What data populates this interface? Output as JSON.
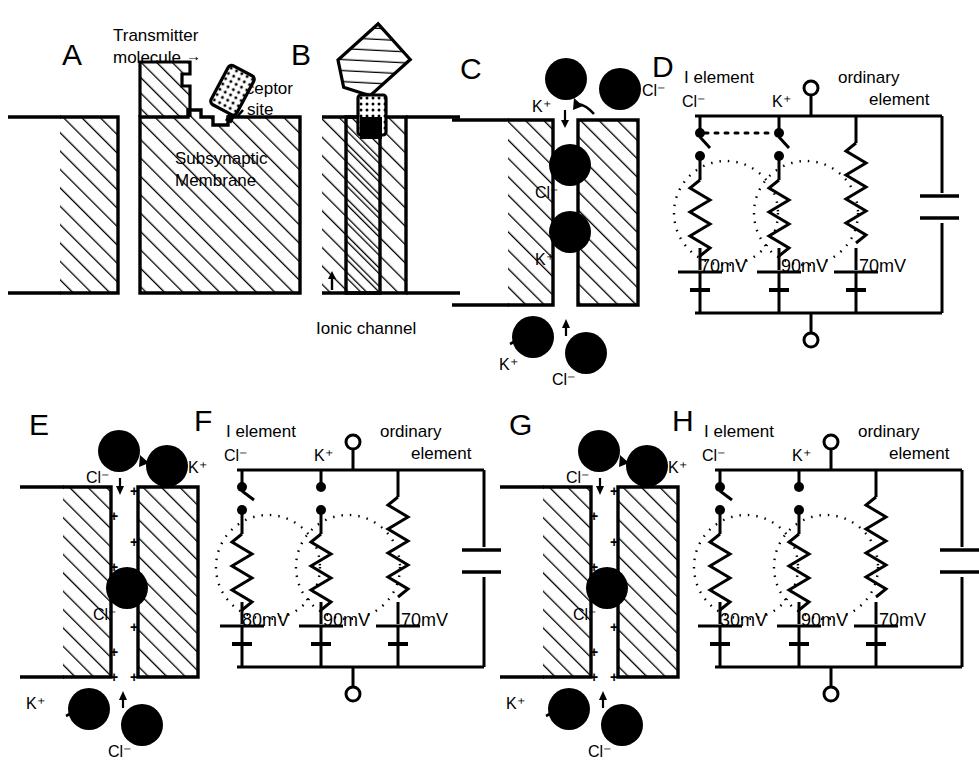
{
  "figure": {
    "background": "#ffffff",
    "ink": "#000000"
  },
  "panels": {
    "A": {
      "label": "A",
      "annotations": {
        "transmitter": "Transmitter",
        "molecule": "molecule",
        "arrow": "→",
        "receptor": "Receptor",
        "site": "site",
        "membrane_line1": "Subsynaptic",
        "membrane_line2": "Membrane"
      }
    },
    "B": {
      "label": "B",
      "annotations": {
        "ionic_channel": "Ionic channel"
      }
    },
    "C": {
      "label": "C",
      "ions": [
        {
          "name": "K+",
          "label": "K⁺",
          "position": "top-outside",
          "arrow": "down"
        },
        {
          "name": "Cl-",
          "label": "Cl⁻",
          "position": "top-right-outside",
          "arrow": "curved"
        },
        {
          "name": "Cl-",
          "label": "Cl⁻",
          "position": "channel-upper",
          "arrow": "none"
        },
        {
          "name": "K+",
          "label": "K⁺",
          "position": "channel-lower",
          "arrow": "none"
        },
        {
          "name": "K+",
          "label": "K⁺",
          "position": "bottom-left-outside",
          "arrow": "curved"
        },
        {
          "name": "Cl-",
          "label": "Cl⁻",
          "position": "bottom-outside",
          "arrow": "up"
        }
      ]
    },
    "D": {
      "label": "D",
      "headers": {
        "i_element": "I element",
        "ordinary_element_line1": "ordinary",
        "ordinary_element_line2": "element"
      },
      "branches": [
        {
          "ion": "Cl⁻",
          "emf": "70mV",
          "switch": "open",
          "linked": true
        },
        {
          "ion": "K⁺",
          "emf": "90mV",
          "switch": "open",
          "linked": true
        },
        {
          "ion": "",
          "emf": "70mV",
          "switch": "none",
          "linked": false
        }
      ],
      "has_capacitor": true,
      "terminals": {
        "top": "open-circle",
        "bottom": "open-circle"
      },
      "dotted_link": true
    },
    "E": {
      "label": "E",
      "ions": [
        {
          "name": "Cl-",
          "label": "Cl⁻",
          "position": "top-outside",
          "arrow": "down"
        },
        {
          "name": "K+",
          "label": "K⁺",
          "position": "top-right-outside",
          "arrow": "curved"
        },
        {
          "name": "Cl-",
          "label": "Cl⁻",
          "position": "channel-middle",
          "arrow": "none"
        },
        {
          "name": "K+",
          "label": "K⁺",
          "position": "bottom-left-outside",
          "arrow": "curved"
        },
        {
          "name": "Cl-",
          "label": "Cl⁻",
          "position": "bottom-outside",
          "arrow": "up"
        }
      ],
      "channel_charges": "+",
      "charge_count": 8
    },
    "F": {
      "label": "F",
      "headers": {
        "i_element": "I element",
        "ordinary_element_line1": "ordinary",
        "ordinary_element_line2": "element"
      },
      "branches": [
        {
          "ion": "Cl⁻",
          "emf": "80mV",
          "switch": "open",
          "linked": false
        },
        {
          "ion": "K⁺",
          "emf": "90mV",
          "switch": "open",
          "linked": false
        },
        {
          "ion": "",
          "emf": "70mV",
          "switch": "none",
          "linked": false
        }
      ],
      "has_capacitor": true,
      "terminals": {
        "top": "open-circle",
        "bottom": "open-circle"
      },
      "dotted_link": false
    },
    "G": {
      "label": "G",
      "ions": [
        {
          "name": "Cl-",
          "label": "Cl⁻",
          "position": "top-outside",
          "arrow": "down"
        },
        {
          "name": "K+",
          "label": "K⁺",
          "position": "top-right-outside",
          "arrow": "curved"
        },
        {
          "name": "Cl-",
          "label": "Cl⁻",
          "position": "channel-middle",
          "arrow": "none"
        },
        {
          "name": "K+",
          "label": "K⁺",
          "position": "bottom-left-outside",
          "arrow": "curved"
        },
        {
          "name": "Cl-",
          "label": "Cl⁻",
          "position": "bottom-outside",
          "arrow": "up"
        }
      ],
      "channel_charges": "+",
      "charge_count": 8
    },
    "H": {
      "label": "H",
      "headers": {
        "i_element": "I element",
        "ordinary_element_line1": "ordinary",
        "ordinary_element_line2": "element"
      },
      "branches": [
        {
          "ion": "Cl⁻",
          "emf": "30mV",
          "switch": "open",
          "linked": false
        },
        {
          "ion": "K⁺",
          "emf": "90mV",
          "switch": "open",
          "linked": false
        },
        {
          "ion": "",
          "emf": "70mV",
          "switch": "none",
          "linked": false
        }
      ],
      "has_capacitor": true,
      "terminals": {
        "top": "open-circle",
        "bottom": "open-circle"
      },
      "dotted_link": false
    }
  }
}
